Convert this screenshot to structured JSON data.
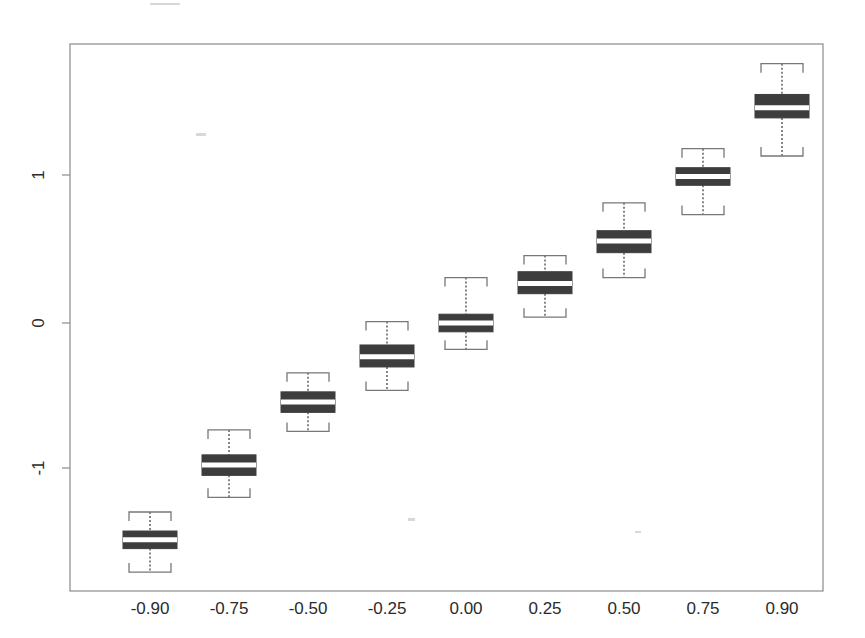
{
  "chart_data": {
    "type": "box",
    "title": "",
    "xlabel": "",
    "ylabel": "",
    "categories": [
      "-0.90",
      "-0.75",
      "-0.50",
      "-0.25",
      "0.00",
      "0.25",
      "0.50",
      "0.75",
      "0.90"
    ],
    "ytick_labels": [
      "1",
      "0",
      "-1"
    ],
    "ytick_values": [
      1,
      0,
      -1
    ],
    "ylim": [
      -1.9,
      2.0
    ],
    "grid": false,
    "legend": null,
    "box_fill_color": "#3d3d3d",
    "median_color": "#ffffff",
    "whisker_color": "#555555",
    "frame_color": "#8a8a8a",
    "boxes": [
      {
        "category": "-0.90",
        "whisker_low": -1.7,
        "q1": -1.54,
        "median": -1.48,
        "q3": -1.42,
        "whisker_high": -1.29
      },
      {
        "category": "-0.75",
        "whisker_low": -1.19,
        "q1": -1.04,
        "median": -0.97,
        "q3": -0.9,
        "whisker_high": -0.73
      },
      {
        "category": "-0.50",
        "whisker_low": -0.74,
        "q1": -0.61,
        "median": -0.54,
        "q3": -0.47,
        "whisker_high": -0.34
      },
      {
        "category": "-0.25",
        "whisker_low": -0.46,
        "q1": -0.3,
        "median": -0.23,
        "q3": -0.15,
        "whisker_high": 0.01
      },
      {
        "category": "0.00",
        "whisker_low": -0.18,
        "q1": -0.06,
        "median": 0.0,
        "q3": 0.06,
        "whisker_high": 0.31
      },
      {
        "category": "0.25",
        "whisker_low": 0.04,
        "q1": 0.2,
        "median": 0.27,
        "q3": 0.35,
        "whisker_high": 0.46
      },
      {
        "category": "0.50",
        "whisker_low": 0.31,
        "q1": 0.48,
        "median": 0.56,
        "q3": 0.63,
        "whisker_high": 0.82
      },
      {
        "category": "0.75",
        "whisker_low": 0.74,
        "q1": 0.94,
        "median": 1.0,
        "q3": 1.06,
        "whisker_high": 1.19
      },
      {
        "category": "0.90",
        "whisker_low": 1.14,
        "q1": 1.4,
        "median": 1.47,
        "q3": 1.56,
        "whisker_high": 1.77
      }
    ]
  },
  "axes": {
    "x_tick_labels": [
      "-0.90",
      "-0.75",
      "-0.50",
      "-0.25",
      "0.00",
      "0.25",
      "0.50",
      "0.75",
      "0.90"
    ],
    "y_tick_labels": [
      "1",
      "0",
      "-1"
    ]
  }
}
